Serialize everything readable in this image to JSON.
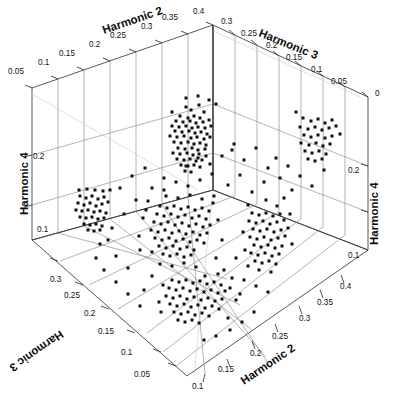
{
  "chart_data": {
    "type": "scatter",
    "projection": "3d",
    "title": "",
    "axes": {
      "harmonic2_top": {
        "label": "Harmonic 2",
        "ticks": [
          "0.05",
          "0.1",
          "0.15",
          "0.2",
          "0.25",
          "0.3",
          "0.35",
          "0.4"
        ]
      },
      "harmonic3_top": {
        "label": "Harmonic 3",
        "ticks": [
          "0.3",
          "0.25",
          "0.2",
          "0.15",
          "0.1",
          "0.05",
          "0"
        ]
      },
      "harmonic4_left": {
        "label": "Harmonic 4",
        "ticks": [
          "0.2",
          "0.1"
        ]
      },
      "harmonic4_right": {
        "label": "Harmonic 4",
        "ticks": [
          "0.2",
          "0.1"
        ]
      },
      "harmonic3_bottom": {
        "label": "Harmonic 3",
        "ticks": [
          "0.3",
          "0.25",
          "0.2",
          "0.15",
          "0.1",
          "0.05"
        ]
      },
      "harmonic2_bottom": {
        "label": "Harmonic 2",
        "ticks": [
          "0.1",
          "0.15",
          "0.2",
          "0.25",
          "0.3",
          "0.35",
          "0.4"
        ]
      }
    },
    "xlabel": "Harmonic 2",
    "ylabel": "Harmonic 3",
    "zlabel": "Harmonic 4",
    "xlim": [
      0.05,
      0.4
    ],
    "ylim": [
      0.0,
      0.3
    ],
    "zlim": [
      0.05,
      0.25
    ],
    "grid": true,
    "legend": null,
    "marker": "square",
    "marker_color": "#101010",
    "marker_size": 3,
    "n_points": 430,
    "clusters": [
      {
        "name": "back-wall-upper-dense",
        "approx_center_px": [
          196,
          134
        ],
        "count": 62
      },
      {
        "name": "left-wall-mid",
        "approx_center_px": [
          92,
          214
        ],
        "count": 34
      },
      {
        "name": "right-wall-upper",
        "approx_center_px": [
          321,
          140
        ],
        "count": 30
      },
      {
        "name": "center-main",
        "approx_center_px": [
          196,
          228
        ],
        "count": 96
      },
      {
        "name": "right-of-center",
        "approx_center_px": [
          266,
          236
        ],
        "count": 58
      },
      {
        "name": "floor-projection",
        "approx_center_px": [
          203,
          288
        ],
        "count": 76
      },
      {
        "name": "scatter-sparse",
        "approx_center_px": [
          190,
          230
        ],
        "count": 74
      }
    ],
    "points_px": [
      [
        186,
        107
      ],
      [
        191,
        110
      ],
      [
        199,
        105
      ],
      [
        204,
        112
      ],
      [
        180,
        116
      ],
      [
        188,
        118
      ],
      [
        194,
        116
      ],
      [
        200,
        118
      ],
      [
        176,
        121
      ],
      [
        183,
        122
      ],
      [
        190,
        121
      ],
      [
        196,
        123
      ],
      [
        203,
        122
      ],
      [
        209,
        120
      ],
      [
        172,
        126
      ],
      [
        179,
        127
      ],
      [
        186,
        126
      ],
      [
        192,
        128
      ],
      [
        198,
        127
      ],
      [
        205,
        128
      ],
      [
        211,
        126
      ],
      [
        175,
        131
      ],
      [
        182,
        132
      ],
      [
        189,
        131
      ],
      [
        195,
        133
      ],
      [
        201,
        132
      ],
      [
        207,
        134
      ],
      [
        170,
        136
      ],
      [
        177,
        137
      ],
      [
        184,
        136
      ],
      [
        191,
        138
      ],
      [
        197,
        137
      ],
      [
        204,
        139
      ],
      [
        210,
        137
      ],
      [
        174,
        142
      ],
      [
        181,
        143
      ],
      [
        188,
        142
      ],
      [
        194,
        144
      ],
      [
        200,
        143
      ],
      [
        206,
        145
      ],
      [
        178,
        148
      ],
      [
        185,
        149
      ],
      [
        192,
        148
      ],
      [
        198,
        150
      ],
      [
        205,
        149
      ],
      [
        173,
        153
      ],
      [
        180,
        154
      ],
      [
        187,
        153
      ],
      [
        193,
        155
      ],
      [
        199,
        154
      ],
      [
        206,
        156
      ],
      [
        177,
        159
      ],
      [
        184,
        160
      ],
      [
        190,
        159
      ],
      [
        196,
        161
      ],
      [
        202,
        160
      ],
      [
        181,
        165
      ],
      [
        188,
        166
      ],
      [
        194,
        165
      ],
      [
        200,
        167
      ],
      [
        185,
        171
      ],
      [
        191,
        172
      ],
      [
        209,
        100
      ],
      [
        216,
        104
      ],
      [
        186,
        98
      ],
      [
        198,
        96
      ],
      [
        172,
        112
      ],
      [
        80,
        196
      ],
      [
        86,
        198
      ],
      [
        92,
        196
      ],
      [
        98,
        199
      ],
      [
        104,
        197
      ],
      [
        78,
        203
      ],
      [
        84,
        205
      ],
      [
        90,
        203
      ],
      [
        96,
        206
      ],
      [
        102,
        204
      ],
      [
        108,
        202
      ],
      [
        76,
        210
      ],
      [
        82,
        211
      ],
      [
        88,
        210
      ],
      [
        94,
        212
      ],
      [
        100,
        211
      ],
      [
        106,
        213
      ],
      [
        80,
        217
      ],
      [
        86,
        218
      ],
      [
        92,
        217
      ],
      [
        98,
        219
      ],
      [
        104,
        218
      ],
      [
        84,
        224
      ],
      [
        90,
        225
      ],
      [
        96,
        224
      ],
      [
        102,
        226
      ],
      [
        88,
        230
      ],
      [
        94,
        231
      ],
      [
        100,
        230
      ],
      [
        79,
        190
      ],
      [
        87,
        189
      ],
      [
        95,
        190
      ],
      [
        103,
        191
      ],
      [
        110,
        190
      ],
      [
        303,
        118
      ],
      [
        311,
        121
      ],
      [
        318,
        119
      ],
      [
        325,
        123
      ],
      [
        332,
        120
      ],
      [
        300,
        127
      ],
      [
        308,
        129
      ],
      [
        315,
        127
      ],
      [
        322,
        130
      ],
      [
        329,
        128
      ],
      [
        336,
        126
      ],
      [
        304,
        135
      ],
      [
        311,
        137
      ],
      [
        318,
        135
      ],
      [
        325,
        138
      ],
      [
        332,
        136
      ],
      [
        301,
        143
      ],
      [
        309,
        145
      ],
      [
        316,
        143
      ],
      [
        323,
        146
      ],
      [
        330,
        144
      ],
      [
        305,
        151
      ],
      [
        312,
        153
      ],
      [
        319,
        151
      ],
      [
        326,
        154
      ],
      [
        308,
        159
      ],
      [
        315,
        161
      ],
      [
        322,
        159
      ],
      [
        296,
        112
      ],
      [
        340,
        134
      ],
      [
        160,
        206
      ],
      [
        167,
        208
      ],
      [
        174,
        206
      ],
      [
        181,
        209
      ],
      [
        188,
        207
      ],
      [
        195,
        210
      ],
      [
        202,
        208
      ],
      [
        209,
        211
      ],
      [
        157,
        214
      ],
      [
        164,
        216
      ],
      [
        171,
        214
      ],
      [
        178,
        217
      ],
      [
        185,
        215
      ],
      [
        192,
        218
      ],
      [
        199,
        216
      ],
      [
        206,
        219
      ],
      [
        154,
        222
      ],
      [
        161,
        224
      ],
      [
        168,
        222
      ],
      [
        175,
        225
      ],
      [
        182,
        223
      ],
      [
        189,
        226
      ],
      [
        196,
        224
      ],
      [
        203,
        227
      ],
      [
        210,
        225
      ],
      [
        151,
        230
      ],
      [
        158,
        232
      ],
      [
        165,
        230
      ],
      [
        172,
        233
      ],
      [
        179,
        231
      ],
      [
        186,
        234
      ],
      [
        193,
        232
      ],
      [
        200,
        235
      ],
      [
        207,
        233
      ],
      [
        155,
        238
      ],
      [
        162,
        240
      ],
      [
        169,
        238
      ],
      [
        176,
        241
      ],
      [
        183,
        239
      ],
      [
        190,
        242
      ],
      [
        197,
        240
      ],
      [
        204,
        243
      ],
      [
        159,
        246
      ],
      [
        166,
        248
      ],
      [
        173,
        246
      ],
      [
        180,
        249
      ],
      [
        187,
        247
      ],
      [
        194,
        250
      ],
      [
        163,
        254
      ],
      [
        170,
        256
      ],
      [
        177,
        254
      ],
      [
        184,
        257
      ],
      [
        191,
        255
      ],
      [
        148,
        201
      ],
      [
        143,
        218
      ],
      [
        139,
        236
      ],
      [
        213,
        203
      ],
      [
        218,
        220
      ],
      [
        222,
        240
      ],
      [
        166,
        196
      ],
      [
        178,
        198
      ],
      [
        190,
        195
      ],
      [
        202,
        199
      ],
      [
        214,
        196
      ],
      [
        146,
        210
      ],
      [
        152,
        252
      ],
      [
        160,
        264
      ],
      [
        172,
        266
      ],
      [
        184,
        263
      ],
      [
        196,
        267
      ],
      [
        252,
        213
      ],
      [
        259,
        215
      ],
      [
        266,
        213
      ],
      [
        273,
        216
      ],
      [
        280,
        214
      ],
      [
        249,
        221
      ],
      [
        256,
        223
      ],
      [
        263,
        221
      ],
      [
        270,
        224
      ],
      [
        277,
        222
      ],
      [
        284,
        220
      ],
      [
        253,
        229
      ],
      [
        260,
        231
      ],
      [
        267,
        229
      ],
      [
        274,
        232
      ],
      [
        281,
        230
      ],
      [
        250,
        237
      ],
      [
        257,
        239
      ],
      [
        264,
        237
      ],
      [
        271,
        240
      ],
      [
        278,
        238
      ],
      [
        285,
        236
      ],
      [
        254,
        245
      ],
      [
        261,
        247
      ],
      [
        268,
        245
      ],
      [
        275,
        248
      ],
      [
        282,
        246
      ],
      [
        251,
        253
      ],
      [
        258,
        255
      ],
      [
        265,
        253
      ],
      [
        272,
        256
      ],
      [
        279,
        254
      ],
      [
        255,
        261
      ],
      [
        262,
        263
      ],
      [
        269,
        261
      ],
      [
        276,
        264
      ],
      [
        248,
        205
      ],
      [
        288,
        228
      ],
      [
        292,
        244
      ],
      [
        245,
        250
      ],
      [
        259,
        270
      ],
      [
        271,
        272
      ],
      [
        266,
        200
      ],
      [
        277,
        206
      ],
      [
        243,
        232
      ],
      [
        290,
        214
      ],
      [
        172,
        280
      ],
      [
        179,
        282
      ],
      [
        186,
        280
      ],
      [
        193,
        283
      ],
      [
        200,
        281
      ],
      [
        207,
        284
      ],
      [
        214,
        282
      ],
      [
        221,
        285
      ],
      [
        169,
        288
      ],
      [
        176,
        290
      ],
      [
        183,
        288
      ],
      [
        190,
        291
      ],
      [
        197,
        289
      ],
      [
        204,
        292
      ],
      [
        211,
        290
      ],
      [
        218,
        293
      ],
      [
        225,
        291
      ],
      [
        166,
        296
      ],
      [
        173,
        298
      ],
      [
        180,
        296
      ],
      [
        187,
        299
      ],
      [
        194,
        297
      ],
      [
        201,
        300
      ],
      [
        208,
        298
      ],
      [
        215,
        301
      ],
      [
        222,
        299
      ],
      [
        170,
        304
      ],
      [
        177,
        306
      ],
      [
        184,
        304
      ],
      [
        191,
        307
      ],
      [
        198,
        305
      ],
      [
        205,
        308
      ],
      [
        212,
        306
      ],
      [
        219,
        309
      ],
      [
        174,
        312
      ],
      [
        181,
        314
      ],
      [
        188,
        312
      ],
      [
        195,
        315
      ],
      [
        202,
        313
      ],
      [
        209,
        316
      ],
      [
        178,
        320
      ],
      [
        185,
        322
      ],
      [
        192,
        320
      ],
      [
        199,
        323
      ],
      [
        163,
        285
      ],
      [
        230,
        288
      ],
      [
        236,
        300
      ],
      [
        159,
        302
      ],
      [
        205,
        276
      ],
      [
        218,
        274
      ],
      [
        232,
        278
      ],
      [
        161,
        312
      ],
      [
        240,
        294
      ],
      [
        228,
        318
      ],
      [
        120,
        188
      ],
      [
        132,
        176
      ],
      [
        145,
        168
      ],
      [
        228,
        185
      ],
      [
        240,
        175
      ],
      [
        252,
        192
      ],
      [
        264,
        182
      ],
      [
        108,
        240
      ],
      [
        116,
        256
      ],
      [
        128,
        268
      ],
      [
        140,
        250
      ],
      [
        236,
        258
      ],
      [
        248,
        266
      ],
      [
        284,
        198
      ],
      [
        232,
        150
      ],
      [
        244,
        160
      ],
      [
        256,
        148
      ],
      [
        268,
        168
      ],
      [
        280,
        178
      ],
      [
        292,
        190
      ],
      [
        136,
        200
      ],
      [
        124,
        214
      ],
      [
        112,
        228
      ],
      [
        100,
        244
      ],
      [
        152,
        188
      ],
      [
        164,
        178
      ],
      [
        216,
        258
      ],
      [
        224,
        270
      ],
      [
        244,
        280
      ],
      [
        256,
        286
      ],
      [
        268,
        292
      ],
      [
        152,
        276
      ],
      [
        144,
        290
      ],
      [
        188,
        186
      ],
      [
        200,
        180
      ],
      [
        212,
        174
      ],
      [
        176,
        182
      ],
      [
        164,
        190
      ],
      [
        300,
        176
      ],
      [
        312,
        186
      ],
      [
        288,
        166
      ],
      [
        276,
        158
      ],
      [
        324,
        170
      ],
      [
        96,
        258
      ],
      [
        104,
        270
      ],
      [
        116,
        282
      ],
      [
        128,
        294
      ],
      [
        140,
        306
      ],
      [
        230,
        330
      ],
      [
        242,
        322
      ],
      [
        254,
        312
      ],
      [
        216,
        336
      ],
      [
        204,
        340
      ],
      [
        198,
        158
      ],
      [
        186,
        166
      ],
      [
        210,
        164
      ],
      [
        222,
        156
      ],
      [
        234,
        144
      ]
    ]
  },
  "view": {
    "background": "#ffffff",
    "pane_line_color": "#8a8a8a",
    "frame_line_color": "#3a3a3a",
    "point_color": "#101010"
  }
}
